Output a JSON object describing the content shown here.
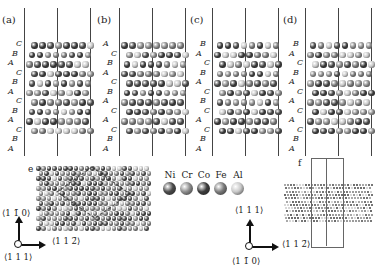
{
  "figure": {
    "panels_top": [
      {
        "id": "a",
        "label": "(a)",
        "x": 24,
        "stacking": [
          "C",
          "B",
          "A",
          "C",
          "B",
          "A",
          "C",
          "B",
          "A",
          "C",
          "B",
          "A"
        ]
      },
      {
        "id": "b",
        "label": "(b)",
        "x": 119,
        "stacking": [
          "A",
          "C",
          "B",
          "A",
          "C",
          "B",
          "A",
          "C",
          "A",
          "C",
          "B",
          "A"
        ]
      },
      {
        "id": "c",
        "label": "(c)",
        "x": 212,
        "stacking": [
          "B",
          "A",
          "C",
          "B",
          "A",
          "C",
          "B",
          "C",
          "A",
          "C",
          "B",
          "A"
        ]
      },
      {
        "id": "d",
        "label": "(d)",
        "x": 305,
        "stacking": [
          "B",
          "A",
          "C",
          "B",
          "A",
          "C",
          "A",
          "C",
          "A",
          "C",
          "B",
          "A"
        ]
      }
    ],
    "panel_e": {
      "label": "e",
      "axis_up": "⟨1 1̄ 0⟩",
      "axis_right": "⟨1 1 2̄⟩",
      "axis_origin": "⟨1 1 1⟩"
    },
    "panel_f": {
      "label": "f",
      "axis_up": "⟨1 1 1⟩",
      "axis_right": "⟨1 1 2̄⟩",
      "axis_origin": "⟨1 1̄ 0⟩"
    },
    "legend": [
      {
        "element": "Ni",
        "color": "#4a4a4a"
      },
      {
        "element": "Cr",
        "color": "#8c8c8c"
      },
      {
        "element": "Co",
        "color": "#3c3c3c"
      },
      {
        "element": "Fe",
        "color": "#7a7a7a"
      },
      {
        "element": "Al",
        "color": "#c8c8c8"
      }
    ]
  }
}
